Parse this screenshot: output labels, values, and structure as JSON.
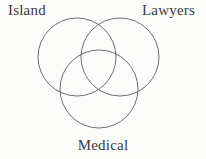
{
  "figure": {
    "type": "venn-diagram-3-set",
    "background_color": "#fcfcfb",
    "stroke_color": "#5d5d63",
    "stroke_width": 0.9,
    "text_color": "#3a3a3c",
    "sets": [
      {
        "id": "island",
        "label": "Island",
        "label_position": "top-left",
        "circle": {
          "cx": 77,
          "cy": 57,
          "r": 39
        }
      },
      {
        "id": "lawyers",
        "label": "Lawyers",
        "label_position": "top-right",
        "circle": {
          "cx": 120,
          "cy": 57,
          "r": 39
        }
      },
      {
        "id": "medical",
        "label": "Medical",
        "label_position": "bottom-center",
        "circle": {
          "cx": 99,
          "cy": 89,
          "r": 39
        }
      }
    ]
  }
}
